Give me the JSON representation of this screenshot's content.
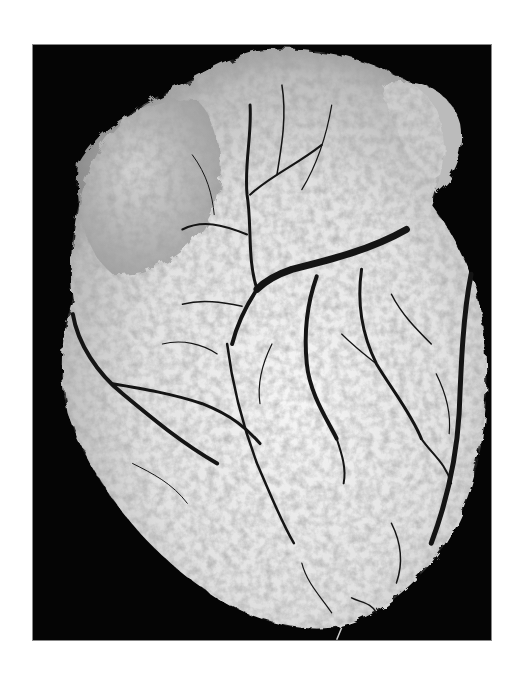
{
  "image": {
    "subject": "Photograph of a human heart with the coronary vascular tree injected/highlighted in dark contrast on a pale myocardium, against a black background",
    "alt_text": "Heart with branching coronary vessels",
    "colors": {
      "background_page": "#ffffff",
      "photo_background": "#050505",
      "tissue": "#e6e6e6",
      "vessels": "#141414"
    }
  }
}
